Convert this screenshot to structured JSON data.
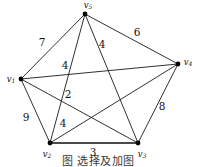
{
  "figure": {
    "caption": "图                 选择及加图",
    "background_color": "#ffffff",
    "ink_color": "#111111"
  },
  "chart_data": {
    "type": "diagram",
    "diagram_kind": "weighted-undirected-graph",
    "title": "",
    "vertex_count": 5,
    "edge_count": 10,
    "nodes": [
      {
        "id": "v1",
        "label": "v",
        "subscript": "1",
        "x": 21,
        "y": 79,
        "label_x": 11,
        "label_y": 79
      },
      {
        "id": "v2",
        "label": "v",
        "subscript": "2",
        "x": 50,
        "y": 143,
        "label_x": 47,
        "label_y": 154
      },
      {
        "id": "v3",
        "label": "v",
        "subscript": "3",
        "x": 138,
        "y": 143,
        "label_x": 142,
        "label_y": 154
      },
      {
        "id": "v4",
        "label": "v",
        "subscript": "4",
        "x": 178,
        "y": 64,
        "label_x": 188,
        "label_y": 62
      },
      {
        "id": "v5",
        "label": "v",
        "subscript": "5",
        "x": 85,
        "y": 14,
        "label_x": 88,
        "label_y": 5
      }
    ],
    "edges": [
      {
        "id": "e-v1-v5",
        "source": "v1",
        "target": "v5",
        "weight": 7,
        "label_x": 42,
        "label_y": 43,
        "style": "thin"
      },
      {
        "id": "e-v5-v4",
        "source": "v5",
        "target": "v4",
        "weight": 6,
        "label_x": 137,
        "label_y": 33,
        "style": "thin"
      },
      {
        "id": "e-v5-v3",
        "source": "v5",
        "target": "v3",
        "weight": 4,
        "label_x": 102,
        "label_y": 45,
        "style": "thin"
      },
      {
        "id": "e-v1-v4",
        "source": "v1",
        "target": "v4",
        "weight": 4,
        "label_x": 65,
        "label_y": 66,
        "style": "thin"
      },
      {
        "id": "e-v1-v3",
        "source": "v1",
        "target": "v3",
        "weight": 2,
        "label_x": 68,
        "label_y": 95,
        "style": "thin"
      },
      {
        "id": "e-v1-v2",
        "source": "v1",
        "target": "v2",
        "weight": 9,
        "label_x": 26,
        "label_y": 118,
        "style": "thin"
      },
      {
        "id": "e-v2-v4",
        "source": "v2",
        "target": "v4",
        "weight": 4,
        "label_x": 63,
        "label_y": 124,
        "style": "thin"
      },
      {
        "id": "e-v2-v3",
        "source": "v2",
        "target": "v3",
        "weight": 3,
        "label_x": 93,
        "label_y": 153,
        "style": "thick"
      },
      {
        "id": "e-v3-v4",
        "source": "v3",
        "target": "v4",
        "weight": 8,
        "label_x": 162,
        "label_y": 107,
        "style": "thin"
      },
      {
        "id": "e-v2-v5",
        "source": "v2",
        "target": "v5",
        "weight": null,
        "label_x": null,
        "label_y": null,
        "style": "thin"
      }
    ],
    "weights_listed": [
      7,
      6,
      4,
      4,
      2,
      9,
      4,
      3,
      8
    ],
    "legend": [],
    "grid": false
  }
}
